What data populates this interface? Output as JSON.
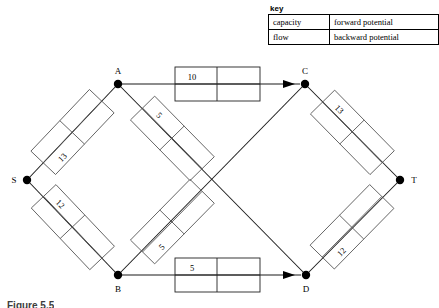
{
  "key": {
    "title": "key",
    "rows": [
      {
        "left": "capacity",
        "right": "forward potential"
      },
      {
        "left": "flow",
        "right": "backward potential"
      }
    ]
  },
  "caption": "Figure 5.5",
  "graph": {
    "nodes": [
      {
        "id": "S",
        "label": "S",
        "x": 27,
        "y": 180
      },
      {
        "id": "A",
        "label": "A",
        "x": 118,
        "y": 84
      },
      {
        "id": "B",
        "label": "B",
        "x": 118,
        "y": 275
      },
      {
        "id": "C",
        "label": "C",
        "x": 305,
        "y": 84
      },
      {
        "id": "D",
        "label": "D",
        "x": 306,
        "y": 275
      },
      {
        "id": "T",
        "label": "T",
        "x": 400,
        "y": 180
      }
    ],
    "edges": [
      {
        "from": "S",
        "to": "A",
        "capacity": "13",
        "flow": "",
        "forward_potential": "",
        "backward_potential": "",
        "arrow": false
      },
      {
        "from": "S",
        "to": "B",
        "capacity": "12",
        "flow": "",
        "forward_potential": "",
        "backward_potential": "",
        "arrow": false
      },
      {
        "from": "A",
        "to": "C",
        "capacity": "10",
        "flow": "",
        "forward_potential": "",
        "backward_potential": "",
        "arrow": true
      },
      {
        "from": "A",
        "to": "D",
        "capacity": "5",
        "flow": "",
        "forward_potential": "",
        "backward_potential": "",
        "arrow": false
      },
      {
        "from": "B",
        "to": "C",
        "capacity": "5",
        "flow": "",
        "forward_potential": "",
        "backward_potential": "",
        "arrow": false
      },
      {
        "from": "B",
        "to": "D",
        "capacity": "5",
        "flow": "",
        "forward_potential": "",
        "backward_potential": "",
        "arrow": true
      },
      {
        "from": "C",
        "to": "T",
        "capacity": "13",
        "flow": "",
        "forward_potential": "",
        "backward_potential": "",
        "arrow": false
      },
      {
        "from": "D",
        "to": "T",
        "capacity": "12",
        "flow": "",
        "forward_potential": "",
        "backward_potential": "",
        "arrow": false
      }
    ]
  }
}
